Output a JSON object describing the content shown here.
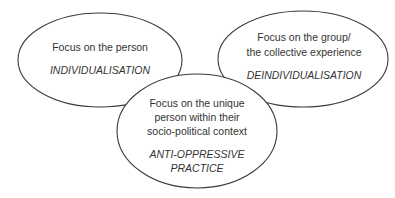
{
  "diagram": {
    "type": "overlapping-ellipses",
    "circles": [
      {
        "id": "individualisation",
        "lines": [
          "Focus on the person"
        ],
        "label": "INDIVIDUALISATION"
      },
      {
        "id": "deindividualisation",
        "lines": [
          "Focus on the group/",
          "the collective experience"
        ],
        "label": "DEINDIVIDUALISATION"
      },
      {
        "id": "anti-oppressive-practice",
        "lines": [
          "Focus on the unique",
          "person within their",
          "socio-political context"
        ],
        "label_lines": [
          "ANTI-OPPRESSIVE",
          "PRACTICE"
        ]
      }
    ],
    "colors": {
      "stroke": "#3a3a3a",
      "text": "#333333",
      "fill": "#ffffff",
      "background": "#ffffff"
    }
  }
}
